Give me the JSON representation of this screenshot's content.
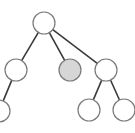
{
  "diagram": {
    "type": "tree",
    "colors": {
      "background": "#ffffff",
      "edge": "#3a3a3a",
      "node_stroke": "#7a7a7a",
      "node_fill": "#ffffff",
      "highlight_fill": "#d6d6d6"
    },
    "node_radius": 11,
    "nodes": [
      {
        "id": "root",
        "x": 44,
        "y": 23,
        "highlighted": false
      },
      {
        "id": "left",
        "x": 16,
        "y": 70,
        "highlighted": false
      },
      {
        "id": "middle",
        "x": 70,
        "y": 70,
        "highlighted": true
      },
      {
        "id": "right",
        "x": 106,
        "y": 70,
        "highlighted": false
      },
      {
        "id": "left-left",
        "x": -1,
        "y": 111,
        "highlighted": false
      },
      {
        "id": "right-left",
        "x": 89,
        "y": 110,
        "highlighted": false
      },
      {
        "id": "right-right",
        "x": 124,
        "y": 110,
        "highlighted": false
      }
    ],
    "edges": [
      {
        "from": "root",
        "to": "left"
      },
      {
        "from": "root",
        "to": "middle"
      },
      {
        "from": "root",
        "to": "right"
      },
      {
        "from": "left",
        "to": "left-left"
      },
      {
        "from": "right",
        "to": "right-left"
      },
      {
        "from": "right",
        "to": "right-right"
      }
    ]
  }
}
